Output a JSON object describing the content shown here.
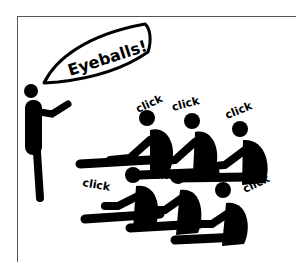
{
  "cartoon": {
    "speech_bubble": {
      "text": "Eyeballs!"
    },
    "click_labels": [
      {
        "text": "click"
      },
      {
        "text": "click"
      },
      {
        "text": "click"
      },
      {
        "text": "click"
      },
      {
        "text": "click"
      },
      {
        "text": "click"
      }
    ],
    "colors": {
      "ink": "#000000",
      "paper": "#ffffff",
      "frame": "#555555"
    }
  }
}
